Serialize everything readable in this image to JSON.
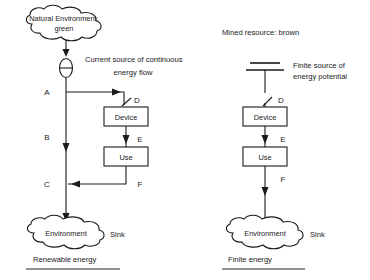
{
  "figure": {
    "title_left": "Renewable energy",
    "title_right": "Finite energy"
  },
  "panels": [
    {
      "id": "renewable",
      "caption": "Renewable energy",
      "source_note": "Natural Environment: green",
      "source_symbol": "current-source-circle",
      "source_description_line1": "Current source of continuous",
      "source_description_line2": "energy flow",
      "source_cloud_label": "Natural Environment: green",
      "source_cloud_label_line1": "Natural Environment:",
      "source_cloud_label_line2": "green",
      "device_label": "Device",
      "use_label": "Use",
      "sink_cloud_label": "Environment",
      "sink_note": "Sink",
      "flow_labels": {
        "a": "A",
        "b": "B",
        "c": "C",
        "d": "D",
        "e": "E",
        "f": "F"
      }
    },
    {
      "id": "finite",
      "caption": "Finite energy",
      "source_note": "Mined resource: brown",
      "source_symbol": "finite-stock-bars",
      "source_description_line1": "Finite source of",
      "source_description_line2": "energy potential",
      "device_label": "Device",
      "use_label": "Use",
      "sink_cloud_label": "Environment",
      "sink_note": "Sink",
      "flow_labels": {
        "d": "D",
        "e": "E",
        "f": "F"
      }
    }
  ],
  "colors": {
    "ink": "#1a1a1a",
    "rule": "#6b6b6b",
    "background": "#ffffff"
  }
}
